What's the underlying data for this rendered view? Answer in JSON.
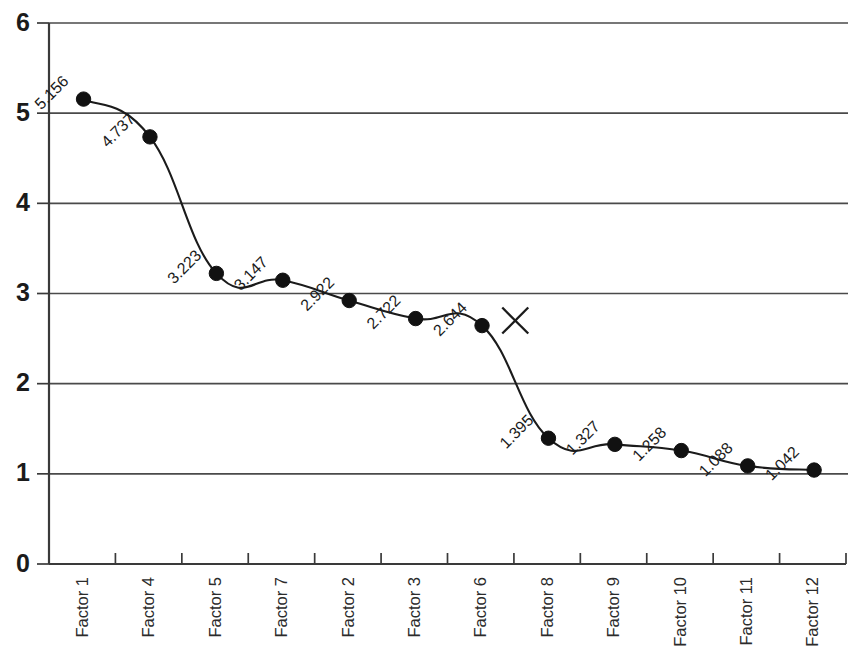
{
  "chart_data": {
    "type": "line",
    "title": "",
    "subtitle": "",
    "xlabel": "",
    "ylabel": "",
    "categories": [
      "Factor 1",
      "Factor 4",
      "Factor 5",
      "Factor 7",
      "Factor 2",
      "Factor 3",
      "Factor 6",
      "Factor 8",
      "Factor 9",
      "Factor 10",
      "Factor 11",
      "Factor 12"
    ],
    "values": [
      5.156,
      4.737,
      3.223,
      3.147,
      2.922,
      2.722,
      2.644,
      1.395,
      1.327,
      1.258,
      1.088,
      1.042
    ],
    "data_labels": [
      "5.156",
      "4.737",
      "3.223",
      "3.147",
      "2.922",
      "2.722",
      "2.644",
      "1.395",
      "1.327",
      "1.258",
      "1.088",
      "1.042"
    ],
    "ylim": [
      0,
      6
    ],
    "ytick_labels": [
      "0",
      "1",
      "2",
      "3",
      "4",
      "5",
      "6"
    ],
    "ytick_values": [
      0,
      1,
      2,
      3,
      4,
      5,
      6
    ],
    "grid": "horizontal",
    "legend": "none",
    "marker": "filled-circle",
    "line_color": "#1b1b1b",
    "marker_color": "#111111",
    "grid_color": "#4a4a4a",
    "axis_color": "#3a3a3a",
    "background_color": "#ffffff",
    "data_label_rotation_deg": -45,
    "xtick_label_rotation_deg": -90,
    "annotations": [
      {
        "name": "x-cross-marker",
        "glyph": "X",
        "x_position_index": 6.5,
        "y_value": 2.7
      }
    ]
  }
}
